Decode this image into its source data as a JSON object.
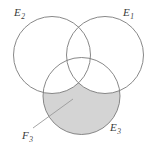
{
  "figure": {
    "type": "venn-diagram-three-circles",
    "background_color": "#ffffff",
    "stroke_color": "#7a7a7a",
    "shade_color": "#d4d4d4",
    "leader_color": "#9a9a9a",
    "labels": {
      "e1": {
        "base": "E",
        "sub": "1"
      },
      "e2": {
        "base": "E",
        "sub": "2"
      },
      "e3": {
        "base": "E",
        "sub": "3"
      },
      "f3": {
        "base": "F",
        "sub": "3"
      }
    },
    "circles": [
      {
        "name": "E2",
        "cx": 52,
        "cy": 55,
        "r": 38.5
      },
      {
        "name": "E1",
        "cx": 105,
        "cy": 55,
        "r": 38.5
      },
      {
        "name": "E3",
        "cx": 81.5,
        "cy": 96,
        "r": 38.5
      }
    ],
    "shaded_region": "E3 minus (E1 union E2)",
    "leader_line": {
      "x1": 33,
      "y1": 128,
      "x2": 73,
      "y2": 99
    }
  }
}
